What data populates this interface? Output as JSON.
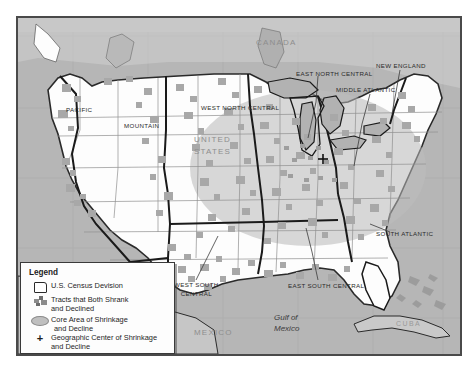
{
  "figure": {
    "frame_border_color": "#4a4a4a",
    "ocean_color": "#b6b6b6",
    "land_color": "#fdfdfd",
    "tract_color": "#a8a8a8",
    "core_area_color": "#c2c2c2"
  },
  "labels": {
    "countries": [
      {
        "name": "canada-label",
        "text": "CANADA",
        "x": 238,
        "y": 26
      },
      {
        "name": "mexico-label",
        "text": "MEXICO",
        "x": 176,
        "y": 316
      },
      {
        "name": "united-states-label-line1",
        "text": "UNITED",
        "x": 176,
        "y": 122
      },
      {
        "name": "united-states-label-line2",
        "text": "STATES",
        "x": 176,
        "y": 134
      }
    ],
    "water": [
      {
        "name": "gulf-of-mexico-label-line1",
        "text": "Gulf of",
        "x": 258,
        "y": 301
      },
      {
        "name": "gulf-of-mexico-label-line2",
        "text": "Mexico",
        "x": 258,
        "y": 312
      }
    ],
    "islands": [
      {
        "name": "cuba-label",
        "text": "CUBA",
        "x": 380,
        "y": 318
      }
    ],
    "census_divisions": [
      {
        "name": "division-label-pacific",
        "text": "PACIFIC",
        "x": 57,
        "y": 92
      },
      {
        "name": "division-label-mountain",
        "text": "MOUNTAIN",
        "x": 115,
        "y": 107
      },
      {
        "name": "division-label-west-north-central",
        "text": "WEST NORTH CENTRAL",
        "x": 190,
        "y": 91
      },
      {
        "name": "division-label-east-north-central",
        "text": "EAST NORTH CENTRAL",
        "x": 288,
        "y": 69
      },
      {
        "name": "division-label-middle-atlantic",
        "text": "MIDDLE ATLANTIC",
        "x": 330,
        "y": 82
      },
      {
        "name": "division-label-new-england",
        "text": "NEW ENGLAND",
        "x": 376,
        "y": 47
      },
      {
        "name": "division-label-south-atlantic",
        "text": "SOUTH ATLANTIC",
        "x": 368,
        "y": 222
      },
      {
        "name": "division-label-east-south-central",
        "text": "EAST SOUTH CENTRAL",
        "x": 280,
        "y": 270
      },
      {
        "name": "division-label-west-south-central-line1",
        "text": "WEST SOUTH",
        "x": 163,
        "y": 268
      },
      {
        "name": "division-label-west-south-central-line2",
        "text": "CENTRAL",
        "x": 171,
        "y": 277
      }
    ]
  },
  "legend": {
    "title": "Legend",
    "items": [
      {
        "name": "legend-item-census-division",
        "symbol": "division-outline-icon",
        "lines": [
          "U.S. Census Devision"
        ],
        "top": 18
      },
      {
        "name": "legend-item-tracts",
        "symbol": "tract-patch-icon",
        "lines": [
          "Tracts that Both Shrank",
          "and Declined"
        ],
        "top": 32
      },
      {
        "name": "legend-item-core-area",
        "symbol": "core-ellipse-icon",
        "lines": [
          "Core Area of Shrinkage",
          "and Decline"
        ],
        "top": 52
      },
      {
        "name": "legend-item-geographic-center",
        "symbol": "plus-marker-icon",
        "lines": [
          "Geographic Center of Shrinkage",
          "and Decline"
        ],
        "top": 70
      }
    ]
  }
}
